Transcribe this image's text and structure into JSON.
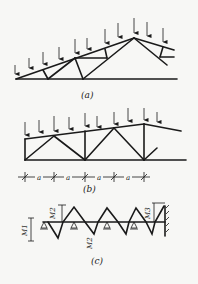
{
  "figure": {
    "panels": [
      {
        "id": "a",
        "caption": "(a)",
        "description": "Triangular roof truss with vertical point loads on top chord"
      },
      {
        "id": "b",
        "caption": "(b)",
        "description": "Parallel-chord truss with point loads, panel spacing a"
      },
      {
        "id": "c",
        "caption": "(c)",
        "description": "Continuous beam model with supports and moments"
      }
    ],
    "dimension_label": "a",
    "dimension_labels": [
      "a",
      "a",
      "a",
      "a"
    ],
    "moment_labels": {
      "m1": "M1",
      "m2": "M2",
      "m3": "M3",
      "m2b": "M2"
    },
    "colors": {
      "line": "#1a1a1a",
      "background": "#f7f7f5"
    }
  }
}
